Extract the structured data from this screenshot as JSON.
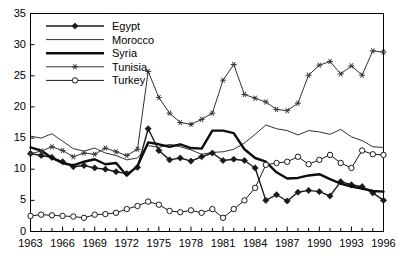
{
  "chart_data": {
    "type": "line",
    "title": "",
    "xlabel": "",
    "ylabel": "",
    "xlim": [
      1963,
      1996
    ],
    "ylim": [
      0,
      35
    ],
    "yticks": [
      0,
      5,
      10,
      15,
      20,
      25,
      30,
      35
    ],
    "xticks": [
      1963,
      1966,
      1969,
      1972,
      1975,
      1978,
      1981,
      1984,
      1987,
      1990,
      1993,
      1996
    ],
    "xtick_minor_step": 1,
    "grid": false,
    "legend_position": "top-left",
    "x": [
      1963,
      1964,
      1965,
      1966,
      1967,
      1968,
      1969,
      1970,
      1971,
      1972,
      1973,
      1974,
      1975,
      1976,
      1977,
      1978,
      1979,
      1980,
      1981,
      1982,
      1983,
      1984,
      1985,
      1986,
      1987,
      1988,
      1989,
      1990,
      1991,
      1992,
      1993,
      1994,
      1995,
      1996
    ],
    "series": [
      {
        "name": "Egypt",
        "marker": "filled-diamond",
        "color": "#1a1a1a",
        "line_width": 1.4,
        "values": [
          12.5,
          12.2,
          11.9,
          11.2,
          10.4,
          10.6,
          10.2,
          10.0,
          9.6,
          9.3,
          10.3,
          16.5,
          13.0,
          11.5,
          11.8,
          11.3,
          12.0,
          12.6,
          11.4,
          11.6,
          11.4,
          10.2,
          5.0,
          5.9,
          4.9,
          6.3,
          6.6,
          6.4,
          5.7,
          8.0,
          7.5,
          7.2,
          6.2,
          5.0
        ]
      },
      {
        "name": "Morocco",
        "marker": "none",
        "color": "#1a1a1a",
        "line_width": 0.9,
        "values": [
          15.3,
          15.0,
          15.7,
          14.5,
          13.3,
          12.9,
          13.4,
          12.6,
          12.2,
          11.5,
          11.8,
          13.8,
          13.5,
          14.0,
          13.6,
          13.1,
          12.4,
          12.7,
          12.8,
          13.2,
          14.2,
          15.6,
          17.1,
          16.5,
          16.2,
          15.5,
          16.2,
          16.0,
          15.6,
          16.4,
          15.2,
          14.6,
          13.6,
          13.5
        ]
      },
      {
        "name": "Syria",
        "marker": "none",
        "color": "#0d0d0d",
        "line_width": 2.4,
        "values": [
          13.5,
          13.0,
          11.8,
          11.0,
          10.6,
          11.2,
          11.6,
          10.8,
          11.0,
          9.0,
          10.5,
          14.3,
          14.0,
          13.6,
          14.0,
          13.4,
          13.3,
          16.2,
          16.2,
          15.8,
          13.2,
          11.8,
          11.2,
          9.5,
          8.5,
          8.6,
          9.0,
          9.2,
          8.4,
          7.7,
          7.2,
          6.9,
          6.5,
          6.4
        ]
      },
      {
        "name": "Tunisia",
        "marker": "asterisk",
        "color": "#333333",
        "line_width": 1.0,
        "values": [
          12.5,
          12.9,
          13.6,
          13.0,
          12.0,
          12.6,
          12.4,
          13.4,
          12.8,
          12.2,
          13.2,
          25.7,
          21.5,
          19.0,
          17.5,
          17.2,
          18.0,
          19.0,
          24.3,
          26.8,
          22.0,
          21.4,
          20.8,
          19.6,
          19.4,
          20.6,
          25.1,
          26.7,
          27.3,
          25.3,
          26.6,
          25.1,
          29.0,
          28.8
        ]
      },
      {
        "name": "Turkey",
        "marker": "open-circle",
        "color": "#1a1a1a",
        "line_width": 1.0,
        "values": [
          2.5,
          2.7,
          2.6,
          2.5,
          2.4,
          2.2,
          2.7,
          2.8,
          3.0,
          3.6,
          4.1,
          4.8,
          4.3,
          3.3,
          3.1,
          3.4,
          3.0,
          3.6,
          2.2,
          3.6,
          5.0,
          7.0,
          10.7,
          11.0,
          11.2,
          12.0,
          10.8,
          11.5,
          12.3,
          11.0,
          10.2,
          13.0,
          12.4,
          12.3
        ]
      }
    ]
  }
}
